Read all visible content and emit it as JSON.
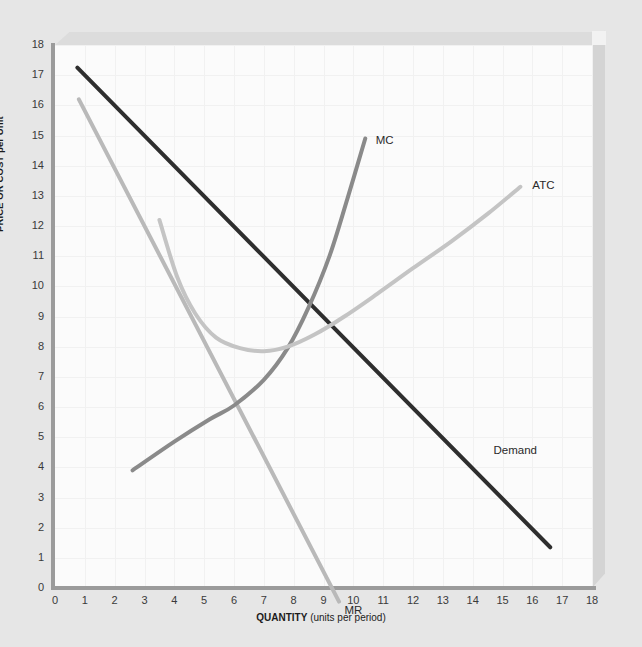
{
  "chart_data": {
    "type": "line",
    "title": "",
    "xlabel_bold": "QUANTITY",
    "xlabel_rest": " (units per period)",
    "ylabel": "PRICE OR COST per Unit",
    "xlim": [
      0,
      18
    ],
    "ylim": [
      0,
      18
    ],
    "xticks": [
      "0",
      "1",
      "2",
      "3",
      "4",
      "5",
      "6",
      "7",
      "8",
      "9",
      "10",
      "11",
      "12",
      "13",
      "14",
      "15",
      "16",
      "17",
      "18"
    ],
    "yticks": [
      "0",
      "1",
      "2",
      "3",
      "4",
      "5",
      "6",
      "7",
      "8",
      "9",
      "10",
      "11",
      "12",
      "13",
      "14",
      "15",
      "16",
      "17",
      "18"
    ],
    "grid": true,
    "legend_position": "inline-labels",
    "series": [
      {
        "name": "Demand",
        "label": "Demand",
        "color": "#2e2e2e",
        "width": 4,
        "type": "line",
        "points": [
          [
            0.75,
            17.25
          ],
          [
            16.6,
            1.35
          ]
        ]
      },
      {
        "name": "MR",
        "label": "MR",
        "color": "#b9b9b9",
        "width": 4,
        "type": "line",
        "points": [
          [
            0.8,
            16.2
          ],
          [
            9.52,
            -0.45
          ]
        ]
      },
      {
        "name": "MC",
        "label": "MC",
        "color": "#8a8a8a",
        "width": 4,
        "type": "curve",
        "points": [
          [
            2.6,
            3.9
          ],
          [
            4.0,
            4.85
          ],
          [
            5.2,
            5.6
          ],
          [
            6.0,
            6.05
          ],
          [
            7.0,
            6.9
          ],
          [
            7.8,
            7.95
          ],
          [
            8.5,
            9.3
          ],
          [
            9.2,
            11.0
          ],
          [
            9.8,
            12.9
          ],
          [
            10.4,
            14.9
          ]
        ]
      },
      {
        "name": "ATC",
        "label": "ATC",
        "color": "#c4c4c4",
        "width": 4,
        "type": "curve",
        "points": [
          [
            3.5,
            12.2
          ],
          [
            4.1,
            10.3
          ],
          [
            4.7,
            9.1
          ],
          [
            5.4,
            8.3
          ],
          [
            6.2,
            7.95
          ],
          [
            7.0,
            7.85
          ],
          [
            7.8,
            8.0
          ],
          [
            8.7,
            8.4
          ],
          [
            9.7,
            9.0
          ],
          [
            10.8,
            9.75
          ],
          [
            12.0,
            10.6
          ],
          [
            13.3,
            11.5
          ],
          [
            14.5,
            12.4
          ],
          [
            15.6,
            13.3
          ]
        ]
      }
    ],
    "annotations": [
      {
        "text": "MC",
        "x": 10.75,
        "y": 14.8
      },
      {
        "text": "ATC",
        "x": 16.0,
        "y": 13.3
      },
      {
        "text": "Demand",
        "x": 14.7,
        "y": 4.5
      },
      {
        "text": "MR",
        "x": 9.7,
        "y": -0.8
      }
    ]
  },
  "colors": {
    "background": "#e6e6e6",
    "plot_background": "#fbfbfb",
    "axis": "#9b9b9b",
    "grid": "#f1f1f1",
    "demand": "#2e2e2e",
    "mr": "#b9b9b9",
    "mc": "#8a8a8a",
    "atc": "#c4c4c4"
  }
}
